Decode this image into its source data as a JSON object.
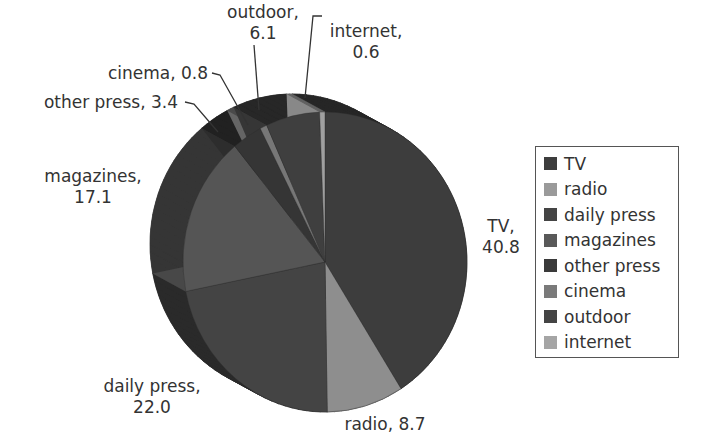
{
  "chart_data": {
    "type": "pie",
    "title": "",
    "style": "3d",
    "categories": [
      "TV",
      "radio",
      "daily press",
      "magazines",
      "other press",
      "cinema",
      "outdoor",
      "internet"
    ],
    "values": [
      40.8,
      8.7,
      22.0,
      17.1,
      3.4,
      0.8,
      6.1,
      0.6
    ],
    "colors": [
      "#3d3d3d",
      "#8e8e8e",
      "#444444",
      "#555555",
      "#353535",
      "#777777",
      "#3f3f3f",
      "#a0a0a0"
    ],
    "start_angle_deg": 0,
    "direction": "clockwise",
    "legend_position": "right"
  },
  "labels": {
    "tv": {
      "name": "TV,",
      "value": "40.8"
    },
    "radio": {
      "text": "radio, 8.7"
    },
    "daily_press": {
      "name": "daily press,",
      "value": "22.0"
    },
    "magazines": {
      "name": "magazines,",
      "value": "17.1"
    },
    "other_press": {
      "text": "other press, 3.4"
    },
    "cinema": {
      "text": "cinema, 0.8"
    },
    "outdoor": {
      "name": "outdoor,",
      "value": "6.1"
    },
    "internet": {
      "name": "internet,",
      "value": "0.6"
    }
  },
  "legend": {
    "items": [
      {
        "label": "TV",
        "color": "#3d3d3d"
      },
      {
        "label": "radio",
        "color": "#9a9a9a"
      },
      {
        "label": "daily press",
        "color": "#444444"
      },
      {
        "label": "magazines",
        "color": "#595959"
      },
      {
        "label": "other press",
        "color": "#3a3a3a"
      },
      {
        "label": "cinema",
        "color": "#7a7a7a"
      },
      {
        "label": "outdoor",
        "color": "#444444"
      },
      {
        "label": "internet",
        "color": "#a5a5a5"
      }
    ]
  }
}
